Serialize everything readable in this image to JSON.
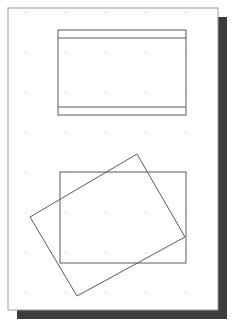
{
  "document": {
    "title": "Rectangle Overlap Figure",
    "width": 235,
    "height": 322,
    "background_color": "#ffffff"
  },
  "page": {
    "label": "drawing-page",
    "x": 8,
    "y": 8,
    "width": 210,
    "height": 302,
    "fill_color": "#ffffff",
    "border_color": "#9a9a9a",
    "border_width": 1
  },
  "shadow": {
    "label": "page-drop-shadow",
    "offset_x": 9,
    "offset_y": 9,
    "color": "#3c3c3c"
  },
  "grid": {
    "label": "dot-grid",
    "visible": true,
    "dot_color": "#cfcfcf",
    "spacing_x": 40,
    "spacing_y": 40,
    "origin_x": 25,
    "origin_y": 12,
    "dot_size": 1.4,
    "columns_x": [
      25,
      65,
      105,
      145,
      185
    ],
    "rows_y": [
      12,
      52,
      92,
      132,
      172,
      212,
      252,
      292
    ]
  },
  "chart_data": {
    "type": "scatter",
    "xlabel": "",
    "ylabel": "",
    "xlim": [
      0,
      235
    ],
    "ylim": [
      0,
      322
    ],
    "grid": true,
    "legend": "none",
    "shapes": [
      {
        "name": "top-banded-rectangle",
        "kind": "rectangle",
        "x": 58,
        "y": 30,
        "width": 128,
        "height": 85,
        "stroke": "#5a5a5a",
        "stroke_width": 1,
        "fill": "none",
        "bands": [
          {
            "name": "top-band-line",
            "y": 38,
            "stroke": "#5a5a5a"
          },
          {
            "name": "bottom-band-line",
            "y": 107,
            "stroke": "#5a5a5a"
          }
        ]
      },
      {
        "name": "lower-axis-aligned-rectangle",
        "kind": "rectangle",
        "x": 60,
        "y": 172,
        "width": 126,
        "height": 91,
        "stroke": "#5a5a5a",
        "stroke_width": 1,
        "fill": "none"
      },
      {
        "name": "lower-rotated-rectangle",
        "kind": "polygon",
        "points": [
          [
            137,
            154
          ],
          [
            185,
            237
          ],
          [
            77,
            296
          ],
          [
            30,
            217
          ]
        ],
        "stroke": "#5a5a5a",
        "stroke_width": 1,
        "fill": "none",
        "rotation_note": "rotated about -28 degrees"
      }
    ],
    "annotations": []
  }
}
